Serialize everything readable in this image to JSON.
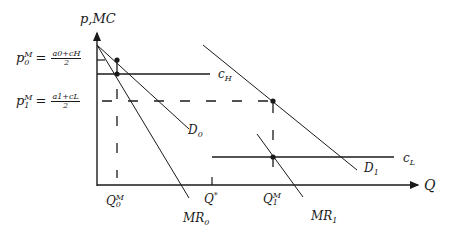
{
  "axes": {
    "y_label": "p,MC",
    "x_label": "Q"
  },
  "price_labels": {
    "p0": {
      "symbol": "p",
      "sub": "0",
      "sup": "M",
      "eq": "=",
      "num": "a0+cH",
      "den": "2"
    },
    "p1": {
      "symbol": "p",
      "sub": "1",
      "sup": "M",
      "eq": "=",
      "num": "a1+cL",
      "den": "2"
    }
  },
  "curves": {
    "cH": {
      "symbol": "c",
      "sub": "H"
    },
    "cL": {
      "symbol": "c",
      "sub": "L"
    },
    "D0": {
      "symbol": "D",
      "sub": "0"
    },
    "D1": {
      "symbol": "D",
      "sub": "1"
    },
    "MR0": {
      "symbol": "MR",
      "sub": "0"
    },
    "MR1": {
      "symbol": "MR",
      "sub": "1"
    }
  },
  "quantity_labels": {
    "Q0M": {
      "symbol": "Q",
      "sub": "0",
      "sup": "M"
    },
    "Qstar": {
      "symbol": "Q",
      "sup": "*"
    },
    "Q1M": {
      "symbol": "Q",
      "sub": "1",
      "sup": "M"
    }
  },
  "colors": {
    "line": "#1a1a1a",
    "background": "#ffffff"
  }
}
